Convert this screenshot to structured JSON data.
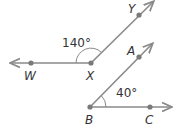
{
  "diagram": {
    "angle1": {
      "vertex": "X",
      "points": [
        "W",
        "Y"
      ],
      "measure_label": "140°"
    },
    "angle2": {
      "vertex": "B",
      "points": [
        "A",
        "C"
      ],
      "measure_label": "40°"
    },
    "labels": {
      "W": "W",
      "X": "X",
      "Y": "Y",
      "A": "A",
      "B": "B",
      "C": "C"
    },
    "colors": {
      "ray": "#8a8a8a",
      "point": "#7a7a7a",
      "text": "#333333"
    }
  }
}
